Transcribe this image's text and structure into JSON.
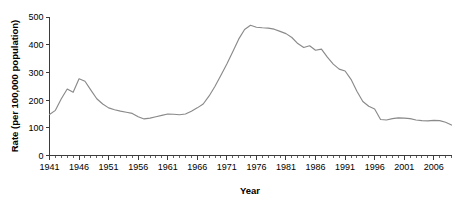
{
  "chart_data": {
    "type": "line",
    "title": "",
    "xlabel": "Year",
    "ylabel": "Rate (per 100,000 population)",
    "xlim": [
      1941,
      2009
    ],
    "ylim": [
      0,
      500
    ],
    "grid": false,
    "legend": null,
    "y_ticks": [
      0,
      100,
      200,
      300,
      400,
      500
    ],
    "y_tick_labels": [
      "0",
      "100",
      "200",
      "300",
      "400",
      "500"
    ],
    "x_major_ticks": [
      1941,
      1946,
      1951,
      1956,
      1961,
      1966,
      1971,
      1976,
      1981,
      1986,
      1991,
      1996,
      2001,
      2006
    ],
    "x_tick_labels": [
      "1941",
      "1946",
      "1951",
      "1956",
      "1961",
      "1966",
      "1971",
      "1976",
      "1981",
      "1986",
      "1991",
      "1996",
      "2001",
      "2006"
    ],
    "x_minor_tick_interval": 1,
    "line_color": "#8a8a8a",
    "axis_color": "#3b3b3b",
    "background_color": "#ffffff",
    "x": [
      1941,
      1942,
      1943,
      1944,
      1945,
      1946,
      1947,
      1948,
      1949,
      1950,
      1951,
      1952,
      1953,
      1954,
      1955,
      1956,
      1957,
      1958,
      1959,
      1960,
      1961,
      1962,
      1963,
      1964,
      1965,
      1966,
      1967,
      1968,
      1969,
      1970,
      1971,
      1972,
      1973,
      1974,
      1975,
      1976,
      1977,
      1978,
      1979,
      1980,
      1981,
      1982,
      1983,
      1984,
      1985,
      1986,
      1987,
      1988,
      1989,
      1990,
      1991,
      1992,
      1993,
      1994,
      1995,
      1996,
      1997,
      1998,
      1999,
      2000,
      2001,
      2002,
      2003,
      2004,
      2005,
      2006,
      2007,
      2008,
      2009
    ],
    "values": [
      148,
      163,
      205,
      240,
      228,
      277,
      268,
      236,
      205,
      186,
      172,
      165,
      160,
      156,
      152,
      140,
      132,
      135,
      140,
      145,
      150,
      149,
      147,
      150,
      160,
      172,
      186,
      215,
      250,
      290,
      330,
      375,
      420,
      455,
      470,
      463,
      461,
      460,
      456,
      448,
      440,
      426,
      404,
      390,
      396,
      380,
      384,
      355,
      330,
      312,
      305,
      275,
      232,
      195,
      178,
      168,
      130,
      128,
      133,
      136,
      135,
      133,
      128,
      126,
      125,
      127,
      126,
      120,
      110
    ],
    "series": [
      {
        "name": "Rate per 100,000 population",
        "values": [
          148,
          163,
          205,
          240,
          228,
          277,
          268,
          236,
          205,
          186,
          172,
          165,
          160,
          156,
          152,
          140,
          132,
          135,
          140,
          145,
          150,
          149,
          147,
          150,
          160,
          172,
          186,
          215,
          250,
          290,
          330,
          375,
          420,
          455,
          470,
          463,
          461,
          460,
          456,
          448,
          440,
          426,
          404,
          390,
          396,
          380,
          384,
          355,
          330,
          312,
          305,
          275,
          232,
          195,
          178,
          168,
          130,
          128,
          133,
          136,
          135,
          133,
          128,
          126,
          125,
          127,
          126,
          120,
          110
        ]
      }
    ],
    "annotations": []
  }
}
